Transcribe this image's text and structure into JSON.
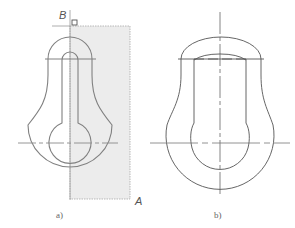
{
  "figure": {
    "panels": [
      {
        "caption": "a)",
        "selection_window": {
          "corner_start_label": "B",
          "corner_end_label": "A",
          "fill_color": "#ececec",
          "border_color": "#9a9a9a"
        }
      },
      {
        "caption": "b)"
      }
    ],
    "colors": {
      "outline_a": "#808080",
      "outline_b": "#555555",
      "centerline": "#8a8a8a"
    }
  }
}
